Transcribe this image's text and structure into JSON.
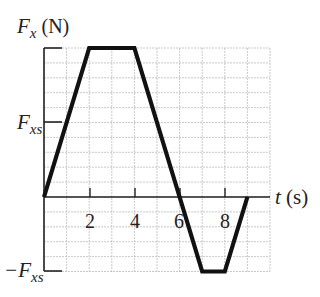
{
  "chart_data": {
    "type": "line",
    "title": "",
    "ylabel": "F_x (N)",
    "xlabel": "t (s)",
    "x": [
      0,
      2,
      4,
      6,
      7,
      8,
      9
    ],
    "series": [
      {
        "name": "F_x(t)",
        "values_in_Fxs": [
          0,
          2,
          2,
          0,
          -1,
          -1,
          0
        ]
      }
    ],
    "x_ticks": [
      2,
      4,
      6,
      8
    ],
    "y_tick_labels": [
      "F_xs",
      "-F_xs"
    ],
    "xlim": [
      0,
      10
    ],
    "ylim_in_Fxs": [
      -1,
      2
    ],
    "grid": true,
    "grid_x_step": 1,
    "grid_y_step_in_Fxs": 0.2,
    "colors": {
      "line": "#111111",
      "grid": "#bbbbbb",
      "axis": "#222222"
    }
  },
  "labels": {
    "y_axis_main": "F",
    "y_axis_sub": "x",
    "y_axis_unit": " (N)",
    "x_axis_main": "t",
    "x_axis_unit": " (s)",
    "fxs_main": "F",
    "fxs_sub": "xs",
    "neg_fxs_main": "−F",
    "neg_fxs_sub": "xs",
    "tick_2": "2",
    "tick_4": "4",
    "tick_6": "6",
    "tick_8": "8"
  }
}
